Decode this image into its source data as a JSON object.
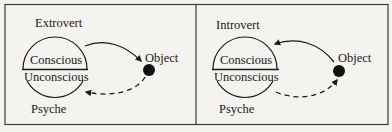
{
  "panels": [
    {
      "title": "Extrovert",
      "upper_label": "Conscious",
      "lower_label": "Unconscious",
      "psyche_label": "Psyche",
      "object_label": "Object",
      "solid_arrow": "psyche-to-object",
      "dashed_arrow": "object-to-psyche"
    },
    {
      "title": "Introvert",
      "upper_label": "Conscious",
      "lower_label": "Unconscious",
      "psyche_label": "Psyche",
      "object_label": "Object",
      "solid_arrow": "object-to-psyche",
      "dashed_arrow": "psyche-to-object"
    }
  ],
  "colors": {
    "background": "#f4f3f0",
    "ink": "#1a1a1a",
    "border": "#3a3a3a"
  }
}
